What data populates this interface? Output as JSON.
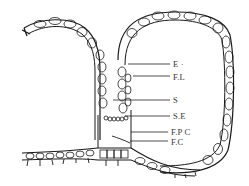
{
  "figure": {
    "type": "anatomical-section-drawing",
    "labels": [
      {
        "id": "E",
        "text": "E ·",
        "x": 173,
        "y": 60
      },
      {
        "id": "FL",
        "text": "F.L",
        "x": 173,
        "y": 74
      },
      {
        "id": "S",
        "text": "S",
        "x": 173,
        "y": 96
      },
      {
        "id": "SE",
        "text": "S.E",
        "x": 173,
        "y": 112
      },
      {
        "id": "FPC",
        "text": "F.P C",
        "x": 173,
        "y": 129
      },
      {
        "id": "FC",
        "text": "F.C",
        "x": 173,
        "y": 142
      }
    ],
    "colors": {
      "ink": "#1a1a1a",
      "background": "#ffffff",
      "label": "#333333"
    }
  }
}
